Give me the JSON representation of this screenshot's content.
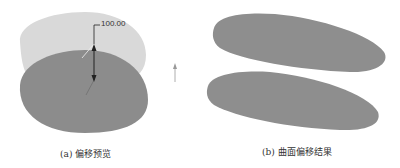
{
  "panel_a": {
    "caption": "(a) 偏移预览",
    "dimension_value": "100.00",
    "colors": {
      "preview_surface": "#d9d9d9",
      "base_surface": "#8c8c8c",
      "arrow": "#222222"
    }
  },
  "panel_b": {
    "caption": "(b) 曲面偏移结果",
    "colors": {
      "surface": "#8e8e8e"
    }
  },
  "direction_arrow": {
    "icon": "arrow-up-icon",
    "color": "#999999"
  }
}
